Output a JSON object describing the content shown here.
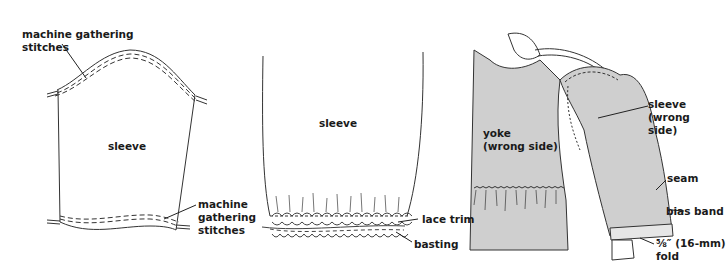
{
  "figure": {
    "fill_color": "#cfcfcf",
    "line_color": "#333333",
    "panels": [
      {
        "id": "panel-1",
        "labels": {
          "top_stitches": [
            "machine gathering",
            "stitches"
          ],
          "piece": "sleeve",
          "bottom_stitches": [
            "machine",
            "gathering",
            "stitches"
          ]
        }
      },
      {
        "id": "panel-2",
        "labels": {
          "piece": "sleeve",
          "lace_trim": "lace trim",
          "basting": "basting"
        }
      },
      {
        "id": "panel-3",
        "labels": {
          "yoke": [
            "yoke",
            "(wrong side)"
          ],
          "sleeve": [
            "sleeve",
            "(wrong",
            "side)"
          ],
          "seam": "seam",
          "bias_band": "bias band",
          "fold": [
            "⅝″ (16-mm)",
            "fold"
          ]
        }
      }
    ]
  }
}
